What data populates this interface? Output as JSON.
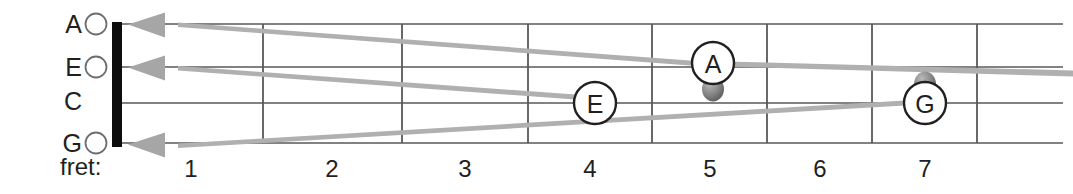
{
  "diagram": {
    "type": "ukulele-fretboard-diagram",
    "fret_axis_label": "fret:",
    "fret_numbers": [
      "1",
      "2",
      "3",
      "4",
      "5",
      "6",
      "7"
    ],
    "strings": [
      {
        "name": "A",
        "open_marker": "open-circle",
        "row": 0
      },
      {
        "name": "E",
        "open_marker": "open-circle",
        "row": 1
      },
      {
        "name": "C",
        "open_marker": "none",
        "row": 2
      },
      {
        "name": "G",
        "open_marker": "open-circle",
        "row": 3
      }
    ],
    "notes": [
      {
        "label": "A",
        "string": "E",
        "fret": 5,
        "dot": "below"
      },
      {
        "label": "E",
        "string": "C",
        "fret": 4,
        "dot": "none"
      },
      {
        "label": "G",
        "string": "C",
        "fret": 7,
        "dot": "above"
      }
    ],
    "arrows": [
      {
        "from_note": "A",
        "to_string": "A",
        "direction": "left"
      },
      {
        "from_note": "E",
        "to_string": "E",
        "direction": "left"
      },
      {
        "from_note": "G",
        "to_string": "G",
        "direction": "left"
      }
    ],
    "colors": {
      "background": "#ffffff",
      "line": "#58595b",
      "nut": "#0d0d0d",
      "text": "#231f20",
      "arrow": "#a6a6a6",
      "dot": "#7f7f7f"
    }
  }
}
